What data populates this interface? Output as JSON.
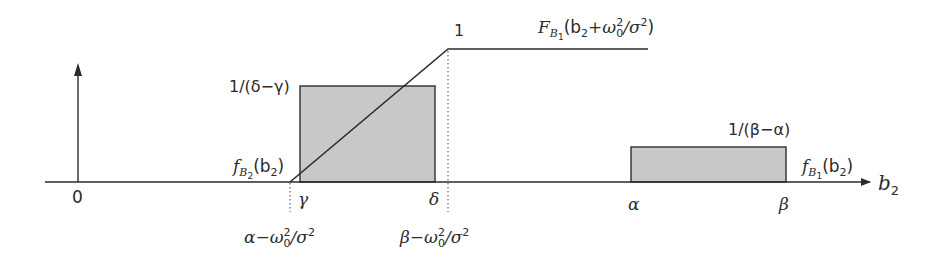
{
  "diagram": {
    "type": "probability-density-and-cdf-sketch",
    "axis": {
      "x_label": "b",
      "x_label_sub": "2",
      "origin_label": "0"
    },
    "ticks": {
      "gamma": "γ",
      "delta": "δ",
      "alpha": "α",
      "beta": "β"
    },
    "lower_ticks": {
      "left_main": "α−ω",
      "left_sub": "0",
      "left_sup": "2",
      "left_tail": "/σ",
      "left_tail_sup": "2",
      "right_main": "β−ω",
      "right_sub": "0",
      "right_sup": "2",
      "right_tail": "/σ",
      "right_tail_sup": "2"
    },
    "left_box": {
      "height_label": "1/(δ−γ)",
      "fn_f": "f",
      "fn_sub": "B",
      "fn_subsub": "2",
      "fn_arg": "(b",
      "fn_arg_sub": "2",
      "fn_close": ")",
      "fill": "#c8c8c8"
    },
    "right_box": {
      "height_label": "1/(β−α)",
      "fn_f": "f",
      "fn_sub": "B",
      "fn_subsub": "1",
      "fn_arg": "(b",
      "fn_arg_sub": "2",
      "fn_close": ")",
      "fill": "#c8c8c8"
    },
    "cdf": {
      "top_label": "1",
      "fn_F": "F",
      "fn_sub": "B",
      "fn_subsub": "1",
      "fn_arg": "(b",
      "fn_arg_sub": "2",
      "fn_plus": "+ω",
      "fn_omega_sub": "0",
      "fn_omega_sup": "2",
      "fn_tail": "/σ",
      "fn_tail_sup": "2",
      "fn_close": ")"
    },
    "colors": {
      "line": "#2b2b2b",
      "box_fill": "#c8c8c8",
      "box_stroke": "#3a3a3a"
    }
  }
}
